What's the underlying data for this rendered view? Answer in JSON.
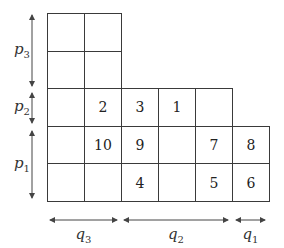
{
  "diagram": {
    "grid": {
      "origin_x": 47,
      "origin_y": 13,
      "cell_w": 37,
      "cell_h": 37.6,
      "rows": [
        [
          "",
          ""
        ],
        [
          "",
          ""
        ],
        [
          "",
          "2",
          "3",
          "1",
          ""
        ],
        [
          "",
          "10",
          "9",
          "",
          "7",
          "8"
        ],
        [
          "",
          "",
          "4",
          "",
          "5",
          "6"
        ]
      ]
    },
    "vertical_arrows": [
      {
        "name": "p3",
        "base": "p",
        "sub": "3",
        "x": 32,
        "y1": 15,
        "y2": 86
      },
      {
        "name": "p2",
        "base": "p",
        "sub": "2",
        "x": 32,
        "y1": 93,
        "y2": 123
      },
      {
        "name": "p1",
        "base": "p",
        "sub": "1",
        "x": 32,
        "y1": 131,
        "y2": 198
      }
    ],
    "horizontal_arrows": [
      {
        "name": "q3",
        "base": "q",
        "sub": "3",
        "y": 220,
        "x1": 50,
        "x2": 117
      },
      {
        "name": "q2",
        "base": "q",
        "sub": "2",
        "y": 220,
        "x1": 124,
        "x2": 228
      },
      {
        "name": "q1",
        "base": "q",
        "sub": "1",
        "y": 220,
        "x1": 236,
        "x2": 265
      }
    ],
    "colors": {
      "line": "#3a3a3a",
      "arrow": "#444444",
      "text": "#222222"
    }
  }
}
